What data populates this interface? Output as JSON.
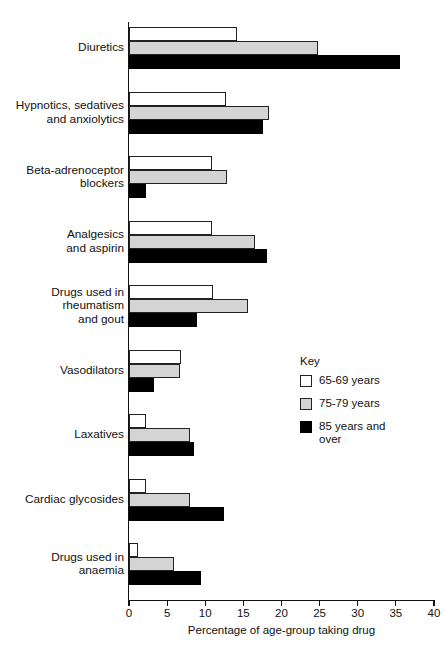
{
  "chart_data": {
    "type": "bar",
    "orientation": "horizontal",
    "title": "",
    "xlabel": "Percentage of age-group taking drug",
    "ylabel": "",
    "xlim": [
      0,
      40
    ],
    "xticks": [
      0,
      5,
      10,
      15,
      20,
      25,
      30,
      35,
      40
    ],
    "xtick_labels": [
      "0",
      "5",
      "10",
      "15",
      "20",
      "25",
      "30",
      "35",
      "40"
    ],
    "grid": false,
    "legend_position": "middle-right",
    "legend_title": "Key",
    "categories": [
      "Diuretics",
      "Hypnotics, sedatives\nand anxiolytics",
      "Beta-adrenoceptor\nblockers",
      "Analgesics\nand aspirin",
      "Drugs used in\nrheumatism\nand gout",
      "Vasodilators",
      "Laxatives",
      "Cardiac glycosides",
      "Drugs used in\nanaemia"
    ],
    "series": [
      {
        "name": "65-69 years",
        "color": "#ffffff",
        "values": [
          14.2,
          12.7,
          10.9,
          10.9,
          11.0,
          6.8,
          2.2,
          2.2,
          1.2
        ]
      },
      {
        "name": "75-79 years",
        "color": "#d4d4d4",
        "values": [
          24.8,
          18.4,
          12.8,
          16.5,
          15.6,
          6.7,
          8.0,
          8.0,
          5.9
        ]
      },
      {
        "name": "85 years and\nover",
        "color": "#000000",
        "values": [
          35.5,
          17.6,
          2.2,
          18.1,
          8.9,
          3.3,
          8.5,
          12.5,
          9.4
        ]
      }
    ]
  }
}
